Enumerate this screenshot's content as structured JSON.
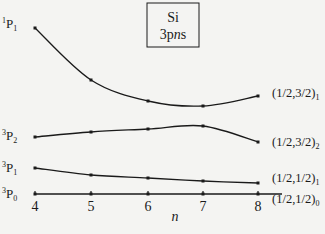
{
  "chart_data": {
    "type": "line",
    "title": "",
    "legend_box": [
      "Si",
      "3pns"
    ],
    "xlabel": "n",
    "ylabel": "",
    "x": [
      4,
      5,
      6,
      7,
      8
    ],
    "x_tick_labels": [
      "4",
      "5",
      "6",
      "7",
      "8"
    ],
    "grid": false,
    "left_labels": [
      {
        "sup": "1",
        "base": "P",
        "sub": "1"
      },
      {
        "sup": "3",
        "base": "P",
        "sub": "2"
      },
      {
        "sup": "3",
        "base": "P",
        "sub": "1"
      },
      {
        "sup": "3",
        "base": "P",
        "sub": "0"
      }
    ],
    "right_labels": [
      {
        "main": "(1/2,3/2)",
        "sub": "1"
      },
      {
        "main": "(1/2,3/2)",
        "sub": "2"
      },
      {
        "main": "(1/2,1/2)",
        "sub": "1"
      },
      {
        "main": "(1/2,1/2)",
        "sub": "0"
      }
    ],
    "series": [
      {
        "name": "1P1 → (1/2,3/2)1",
        "pixel_y": [
          28,
          80,
          101,
          106,
          96
        ]
      },
      {
        "name": "3P2 → (1/2,3/2)2",
        "pixel_y": [
          137,
          132,
          129,
          126,
          142
        ]
      },
      {
        "name": "3P1 → (1/2,1/2)1",
        "pixel_y": [
          168,
          175,
          178,
          181,
          183
        ]
      },
      {
        "name": "3P0 → (1/2,1/2)0",
        "pixel_y": [
          194,
          194,
          194,
          194,
          194
        ]
      }
    ],
    "note": "Relative level positions (no numeric y-axis shown); 3P0 taken as reference baseline."
  }
}
